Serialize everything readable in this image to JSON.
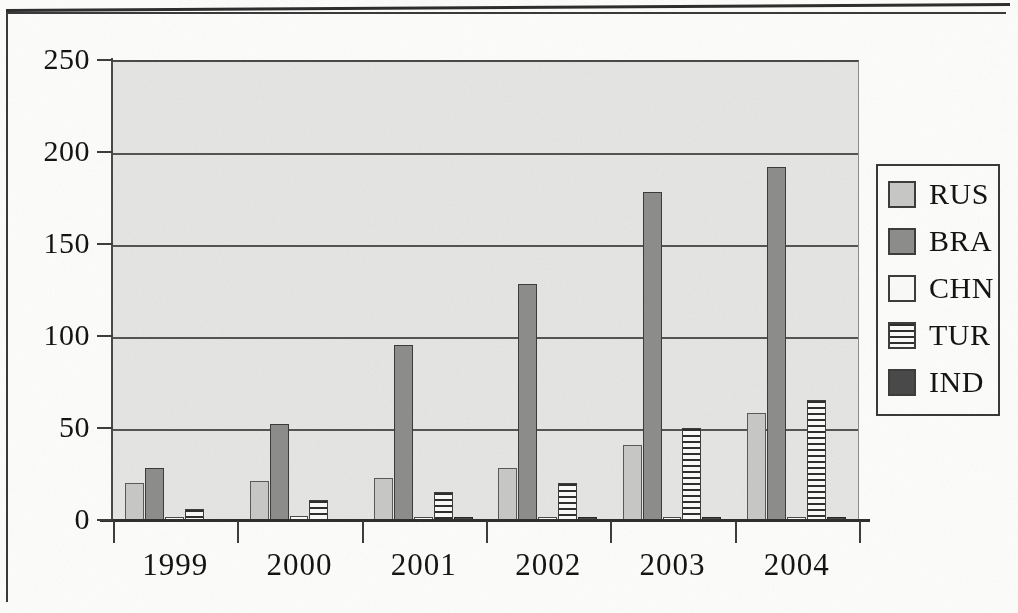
{
  "chart_data": {
    "type": "bar",
    "title": "",
    "subtitle": "",
    "xlabel": "",
    "ylabel": "",
    "categories": [
      "1999",
      "2000",
      "2001",
      "2002",
      "2003",
      "2004"
    ],
    "series": [
      {
        "name": "RUS",
        "color": "#c9c9c7",
        "pattern": "solid-light-gray",
        "values": [
          20,
          21,
          23,
          28,
          41,
          58
        ]
      },
      {
        "name": "BRA",
        "color": "#8e8e8c",
        "pattern": "solid-medium-gray",
        "values": [
          28,
          52,
          95,
          128,
          178,
          192
        ]
      },
      {
        "name": "CHN",
        "color": "#fbfbfa",
        "pattern": "white",
        "values": [
          1,
          2,
          1,
          1,
          1,
          1
        ]
      },
      {
        "name": "TUR",
        "color": "#fbfbfa",
        "pattern": "horizontal-lines",
        "values": [
          6,
          11,
          15,
          20,
          50,
          65
        ]
      },
      {
        "name": "IND",
        "color": "#4a4a4a",
        "pattern": "solid-dark-gray",
        "values": [
          0,
          0,
          1,
          1,
          1,
          1
        ]
      }
    ],
    "ylim": [
      0,
      250
    ],
    "yticks": [
      0,
      50,
      100,
      150,
      200,
      250
    ],
    "ytick_labels": [
      "0",
      "50",
      "100",
      "150",
      "200",
      "250"
    ],
    "grid": true,
    "grid_axis": "y",
    "legend_position": "right-outside",
    "plot_background": "#e6e6e4"
  },
  "legend": {
    "entries": [
      {
        "label": "RUS"
      },
      {
        "label": "BRA"
      },
      {
        "label": "CHN"
      },
      {
        "label": "TUR"
      },
      {
        "label": "IND"
      }
    ]
  },
  "axes": {
    "y_tick_labels": [
      "250",
      "200",
      "150",
      "100",
      "50",
      "0"
    ],
    "x_tick_labels": [
      "1999",
      "2000",
      "2001",
      "2002",
      "2003",
      "2004"
    ]
  }
}
